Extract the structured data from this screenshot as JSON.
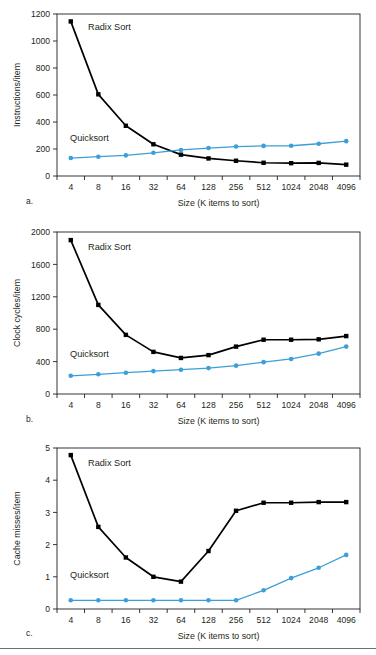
{
  "figure": {
    "panels": [
      {
        "letter": "a.",
        "ylabel": "Instructions/item",
        "xlabel": "Size (K items to sort)",
        "ylim": [
          0,
          1200
        ],
        "yticks": [
          0,
          200,
          400,
          600,
          800,
          1000,
          1200
        ],
        "series_labels": {
          "radix": "Radix Sort",
          "quick": "Quicksort"
        }
      },
      {
        "letter": "b.",
        "ylabel": "Clock cycles/item",
        "xlabel": "Size (K items to sort)",
        "ylim": [
          0,
          2000
        ],
        "yticks": [
          0,
          400,
          800,
          1200,
          1600,
          2000
        ],
        "series_labels": {
          "radix": "Radix Sort",
          "quick": "Quicksort"
        }
      },
      {
        "letter": "c.",
        "ylabel": "Cache misses/item",
        "xlabel": "Size (K items to sort)",
        "ylim": [
          0,
          5
        ],
        "yticks": [
          0,
          1,
          2,
          3,
          4,
          5
        ],
        "series_labels": {
          "radix": "Radix Sort",
          "quick": "Quicksort"
        }
      }
    ]
  },
  "chart_data": [
    {
      "type": "line",
      "title": "",
      "panel": "a",
      "xlabel": "Size (K items to sort)",
      "ylabel": "Instructions/item",
      "categories": [
        "4",
        "8",
        "16",
        "32",
        "64",
        "128",
        "256",
        "512",
        "1024",
        "2048",
        "4096"
      ],
      "ylim": [
        0,
        1200
      ],
      "yticks": [
        0,
        200,
        400,
        600,
        800,
        1000,
        1200
      ],
      "grid": false,
      "legend": "inline-annotation",
      "series": [
        {
          "name": "Radix Sort",
          "color": "#000000",
          "marker": "square",
          "values": [
            1145,
            605,
            372,
            235,
            158,
            130,
            113,
            98,
            95,
            97,
            84
          ]
        },
        {
          "name": "Quicksort",
          "color": "#3d9fd8",
          "marker": "circle",
          "values": [
            133,
            143,
            153,
            172,
            193,
            207,
            218,
            223,
            224,
            239,
            258
          ]
        }
      ]
    },
    {
      "type": "line",
      "title": "",
      "panel": "b",
      "xlabel": "Size (K items to sort)",
      "ylabel": "Clock cycles/item",
      "categories": [
        "4",
        "8",
        "16",
        "32",
        "64",
        "128",
        "256",
        "512",
        "1024",
        "2048",
        "4096"
      ],
      "ylim": [
        0,
        2000
      ],
      "yticks": [
        0,
        400,
        800,
        1200,
        1600,
        2000
      ],
      "grid": false,
      "legend": "inline-annotation",
      "series": [
        {
          "name": "Radix Sort",
          "color": "#000000",
          "marker": "square",
          "values": [
            1900,
            1100,
            730,
            520,
            445,
            480,
            585,
            670,
            670,
            675,
            715
          ]
        },
        {
          "name": "Quicksort",
          "color": "#3d9fd8",
          "marker": "circle",
          "values": [
            225,
            243,
            263,
            283,
            300,
            320,
            350,
            393,
            433,
            498,
            585
          ]
        }
      ]
    },
    {
      "type": "line",
      "title": "",
      "panel": "c",
      "xlabel": "Size (K items to sort)",
      "ylabel": "Cache misses/item",
      "categories": [
        "4",
        "8",
        "16",
        "32",
        "64",
        "128",
        "256",
        "512",
        "1024",
        "2048",
        "4096"
      ],
      "ylim": [
        0,
        5
      ],
      "yticks": [
        0,
        1,
        2,
        3,
        4,
        5
      ],
      "grid": false,
      "legend": "inline-annotation",
      "series": [
        {
          "name": "Radix Sort",
          "color": "#000000",
          "marker": "square",
          "values": [
            4.78,
            2.55,
            1.6,
            1.0,
            0.85,
            1.8,
            3.05,
            3.3,
            3.3,
            3.32,
            3.32
          ]
        },
        {
          "name": "Quicksort",
          "color": "#3d9fd8",
          "marker": "circle",
          "values": [
            0.27,
            0.27,
            0.27,
            0.27,
            0.27,
            0.27,
            0.27,
            0.58,
            0.96,
            1.28,
            1.68
          ]
        }
      ]
    }
  ],
  "colors": {
    "radix": "#000000",
    "quicksort": "#3d9fd8",
    "axis": "#231f20",
    "rule": "#6f7072"
  }
}
